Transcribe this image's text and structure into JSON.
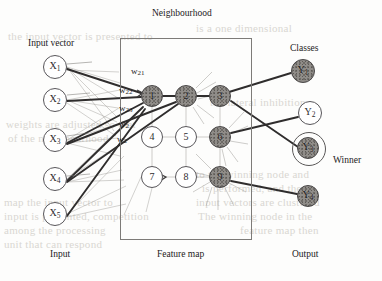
{
  "figure": {
    "neighbourhood_label": "Neighbourhood",
    "input_vector_label": "Input vector",
    "classes_label": "Classes",
    "winner_label": "Winner",
    "bottom_labels": {
      "input": "Input",
      "feature_map": "Feature map",
      "output": "Output"
    }
  },
  "colors": {
    "ink": "#232122",
    "line": "#3a3838",
    "thin_line": "#9a9894",
    "node_fill": "#8f8c88",
    "node_stroke": "#58565a",
    "paper": "#fdfdfc",
    "ghost_text": "#d9d7d2"
  },
  "input_layer": {
    "label": "Input vector",
    "nodes": [
      {
        "id": "x1",
        "text": "X",
        "sub": "1",
        "cx": 55,
        "cy": 67,
        "r": 12,
        "filled": false
      },
      {
        "id": "x2",
        "text": "X",
        "sub": "2",
        "cx": 55,
        "cy": 100,
        "r": 12,
        "filled": false
      },
      {
        "id": "x3",
        "text": "X",
        "sub": "3",
        "cx": 55,
        "cy": 140,
        "r": 12,
        "filled": false
      },
      {
        "id": "x4",
        "text": "X",
        "sub": "4",
        "cx": 55,
        "cy": 179,
        "r": 12,
        "filled": false
      },
      {
        "id": "x5",
        "text": "X",
        "sub": "5",
        "cx": 55,
        "cy": 214,
        "r": 12,
        "filled": false
      }
    ]
  },
  "feature_map": {
    "label": "Feature map",
    "box": {
      "x": 120,
      "y": 38,
      "w": 130,
      "h": 200
    },
    "grid_rows": 3,
    "grid_cols": 3,
    "nodes": [
      {
        "id": "n1",
        "text": "1",
        "cx": 152,
        "cy": 96,
        "r": 11,
        "filled": true
      },
      {
        "id": "n2",
        "text": "2",
        "cx": 186,
        "cy": 96,
        "r": 11,
        "filled": true
      },
      {
        "id": "n3",
        "text": "3",
        "cx": 220,
        "cy": 96,
        "r": 11,
        "filled": true
      },
      {
        "id": "n4",
        "text": "4",
        "cx": 152,
        "cy": 137,
        "r": 11,
        "filled": false
      },
      {
        "id": "n5",
        "text": "5",
        "cx": 186,
        "cy": 137,
        "r": 11,
        "filled": false
      },
      {
        "id": "n6",
        "text": "6",
        "cx": 220,
        "cy": 137,
        "r": 11,
        "filled": true
      },
      {
        "id": "n7",
        "text": "7",
        "cx": 152,
        "cy": 177,
        "r": 11,
        "filled": false
      },
      {
        "id": "n8",
        "text": "8",
        "cx": 186,
        "cy": 177,
        "r": 11,
        "filled": false
      },
      {
        "id": "n9",
        "text": "9",
        "cx": 220,
        "cy": 177,
        "r": 11,
        "filled": true
      }
    ]
  },
  "output_layer": {
    "label": "Classes",
    "nodes": [
      {
        "id": "y1",
        "text": "Y",
        "sub": "1",
        "cx": 303,
        "cy": 71,
        "r": 12,
        "filled": true,
        "winner": false
      },
      {
        "id": "y2",
        "text": "Y",
        "sub": "2",
        "cx": 310,
        "cy": 113,
        "r": 12,
        "filled": false,
        "winner": false
      },
      {
        "id": "y3",
        "text": "Y",
        "sub": "3",
        "cx": 308,
        "cy": 148,
        "r": 11,
        "filled": true,
        "winner": true
      },
      {
        "id": "y4",
        "text": "Y",
        "sub": "4",
        "cx": 308,
        "cy": 196,
        "r": 11,
        "filled": true,
        "winner": false
      }
    ]
  },
  "weights": [
    {
      "id": "w21",
      "text": "w",
      "sub": "21",
      "x": 131,
      "y": 66
    },
    {
      "id": "w22",
      "text": "w",
      "sub": "22",
      "x": 119,
      "y": 85
    },
    {
      "id": "w23",
      "text": "w",
      "sub": "23",
      "x": 119,
      "y": 103
    },
    {
      "id": "w2n",
      "text": "w",
      "sub": "2",
      "x": 119,
      "y": 119
    },
    {
      "id": "w2m",
      "text": "w",
      "sub": "2",
      "x": 117,
      "y": 134
    }
  ],
  "background_text": [
    {
      "text": "the input vector is presented to",
      "x": 8,
      "y": 30
    },
    {
      "text": "weights are adjusted so that",
      "x": 6,
      "y": 118
    },
    {
      "text": "of the neighbourhood",
      "x": 8,
      "y": 132
    },
    {
      "text": "map the input vector to",
      "x": 4,
      "y": 196
    },
    {
      "text": "input is presented, competition",
      "x": 4,
      "y": 210
    },
    {
      "text": "among the processing",
      "x": 4,
      "y": 224
    },
    {
      "text": "unit that can respond",
      "x": 4,
      "y": 238
    },
    {
      "text": "is a one dimensional",
      "x": 196,
      "y": 22
    },
    {
      "text": "the lateral inhibition",
      "x": 210,
      "y": 96
    },
    {
      "text": "to the winning node and",
      "x": 196,
      "y": 168
    },
    {
      "text": "is performed, and the",
      "x": 202,
      "y": 182
    },
    {
      "text": "input vectors are clustered",
      "x": 196,
      "y": 196
    },
    {
      "text": "The winning node in the",
      "x": 198,
      "y": 210
    },
    {
      "text": "feature map then",
      "x": 240,
      "y": 224
    }
  ]
}
